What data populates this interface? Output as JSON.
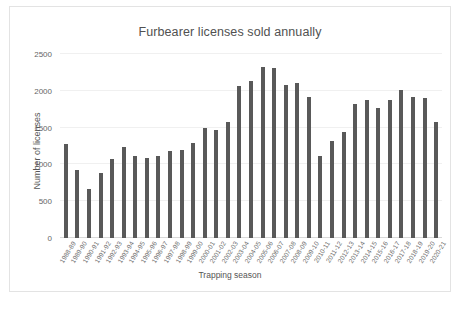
{
  "chart_data": {
    "type": "bar",
    "title": "Furbearer licenses sold annually",
    "xlabel": "Trapping season",
    "ylabel": "Number of licenses",
    "ylim": [
      0,
      2500
    ],
    "ytick_labels": [
      "0",
      "500",
      "1000",
      "1500",
      "2000",
      "2500"
    ],
    "yticks": [
      0,
      500,
      1000,
      1500,
      2000,
      2500
    ],
    "grid": true,
    "legend": false,
    "bar_color": "#595959",
    "gridline_color": "#f0f0f0",
    "categories": [
      "1988-89",
      "1989-90",
      "1990-91",
      "1991-92",
      "1992-93",
      "1993-94",
      "1994-95",
      "1995-96",
      "1996-97",
      "1997-98",
      "1998-99",
      "1999-00",
      "2000-01",
      "2001-02",
      "2002-03",
      "2003-04",
      "2004-05",
      "2005-06",
      "2006-07",
      "2007-08",
      "2008-09",
      "2009-10",
      "2010-11",
      "2011-12",
      "2012-13",
      "2013-14",
      "2014-15",
      "2015-16",
      "2016-17",
      "2017-18",
      "2018-19",
      "2019-20",
      "2020-21"
    ],
    "values": [
      1275,
      920,
      665,
      890,
      1070,
      1230,
      1115,
      1090,
      1115,
      1185,
      1200,
      1285,
      1495,
      1470,
      1570,
      2065,
      2140,
      2330,
      2305,
      2075,
      2110,
      1910,
      1115,
      1315,
      1440,
      1815,
      1880,
      1765,
      1880,
      2015,
      1920,
      1900,
      1580
    ]
  }
}
